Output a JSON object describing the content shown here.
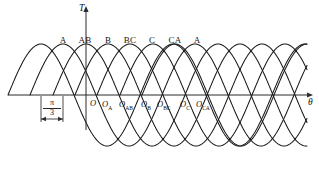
{
  "figure": {
    "type": "waveform-diagram",
    "title": "",
    "background_color": "#ffffff",
    "line_color": "#1a1a1a",
    "axis_color": "#2b2b2b"
  },
  "axes": {
    "vertical_label": "T",
    "horizontal_label": "θ",
    "origin_label": "O",
    "vertical_axis_x": 86,
    "horizontal_axis_y": 95,
    "horizontal_start_x": 8,
    "horizontal_end_x": 307,
    "vertical_top_y": 12,
    "vertical_bottom_y": 130
  },
  "annotation": {
    "numerator": "π",
    "denominator": "3",
    "label": "π/3",
    "left_tick_x": 41,
    "right_tick_x": 63,
    "tick_top_y": 96,
    "tick_bottom_y": 122,
    "dim_line_y": 119
  },
  "peak_labels": [
    {
      "text": "A",
      "x": 63,
      "y": 36
    },
    {
      "text": "AB",
      "x": 85,
      "y": 36
    },
    {
      "text": "B",
      "x": 108,
      "y": 36
    },
    {
      "text": "BC",
      "x": 130,
      "y": 36
    },
    {
      "text": "C",
      "x": 152,
      "y": 36
    },
    {
      "text": "CA",
      "x": 175,
      "y": 36
    },
    {
      "text": "A",
      "x": 197,
      "y": 36
    }
  ],
  "origin_labels": [
    {
      "base": "O",
      "sub": "",
      "x": 90,
      "y": 99
    },
    {
      "base": "O",
      "sub": "A",
      "x": 102,
      "y": 100
    },
    {
      "base": "O",
      "sub": "AB",
      "x": 119,
      "y": 100
    },
    {
      "base": "O",
      "sub": "B",
      "x": 141,
      "y": 100
    },
    {
      "base": "O",
      "sub": "BC",
      "x": 157,
      "y": 100
    },
    {
      "base": "O",
      "sub": "C",
      "x": 180,
      "y": 100
    },
    {
      "base": "O",
      "sub": "CA",
      "x": 196,
      "y": 100
    }
  ],
  "chart_data": {
    "type": "line",
    "title": "",
    "xlabel": "θ",
    "ylabel": "T",
    "grid": false,
    "legend": "inline-peak-labels",
    "x_axis": {
      "unit": "rad",
      "tick_interval": "π/3",
      "tick_interval_value": 1.0472,
      "range_px": [
        8,
        307
      ]
    },
    "y_axis": {
      "unit": "T",
      "zero_line_px": 95,
      "peak_px": 44,
      "trough_px": 164,
      "amplitude_px": 51
    },
    "phase_shift": "π/3",
    "period_px": 132,
    "series": [
      {
        "name": "A",
        "peak_label": "A",
        "origin_label": "O",
        "origin_x_px": 8,
        "peak_x_px": 63,
        "phase_index": 0
      },
      {
        "name": "AB",
        "peak_label": "AB",
        "origin_label": "O_A",
        "origin_x_px": 30,
        "peak_x_px": 85,
        "phase_index": 1
      },
      {
        "name": "B",
        "peak_label": "B",
        "origin_label": "O_AB",
        "origin_x_px": 53,
        "peak_x_px": 108,
        "phase_index": 2
      },
      {
        "name": "BC",
        "peak_label": "BC",
        "origin_label": "O_B",
        "origin_x_px": 75,
        "peak_x_px": 130,
        "phase_index": 3
      },
      {
        "name": "C",
        "peak_label": "C",
        "origin_label": "O_BC",
        "origin_x_px": 97,
        "peak_x_px": 152,
        "phase_index": 4
      },
      {
        "name": "CA",
        "peak_label": "CA",
        "origin_label": "O_C",
        "origin_x_px": 120,
        "peak_x_px": 175,
        "phase_index": 5
      },
      {
        "name": "A2",
        "peak_label": "A",
        "origin_label": "O_CA",
        "origin_x_px": 142,
        "peak_x_px": 197,
        "phase_index": 6
      }
    ],
    "curve_geometry": {
      "zero_y_px": 95,
      "amplitude_px": 51,
      "half_period_px": 66,
      "start_offsets_px": [
        8,
        30,
        53,
        75,
        97,
        120,
        142
      ],
      "x_clip": [
        8,
        307
      ]
    }
  }
}
